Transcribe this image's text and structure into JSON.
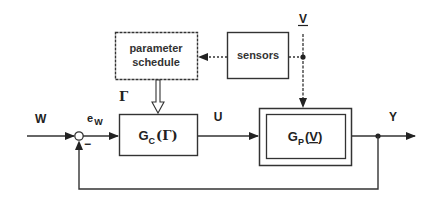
{
  "diagram": {
    "type": "block-diagram",
    "title": "",
    "colors": {
      "stroke": "#333333",
      "background": "#ffffff"
    },
    "blocks": {
      "parameter_schedule": {
        "line1": "parameter",
        "line2": "schedule"
      },
      "sensors": {
        "label": "sensors"
      },
      "controller": {
        "main": "G",
        "sub": "C",
        "arg": "(Γ)"
      },
      "plant": {
        "main": "G",
        "sub": "P",
        "arg_open": "(",
        "arg_var": "V",
        "arg_close": ")"
      }
    },
    "signals": {
      "reference": "W",
      "error_main": "e",
      "error_sub": "W",
      "scheduling_param": "Γ",
      "control": "U",
      "output": "Y",
      "operating_condition": "V"
    },
    "summing_junction": {
      "minus_sign": "−"
    },
    "edges": [
      {
        "from": "W",
        "to": "summing_junction"
      },
      {
        "from": "summing_junction",
        "to": "controller",
        "label": "e_W"
      },
      {
        "from": "controller",
        "to": "plant",
        "label": "U"
      },
      {
        "from": "plant",
        "to": "Y",
        "label": "Y"
      },
      {
        "from": "Y",
        "to": "summing_junction",
        "type": "feedback",
        "sign": "-"
      },
      {
        "from": "V",
        "to": "plant",
        "style": "dashed"
      },
      {
        "from": "V",
        "to": "sensors",
        "style": "dashed"
      },
      {
        "from": "sensors",
        "to": "parameter_schedule",
        "style": "dashed"
      },
      {
        "from": "parameter_schedule",
        "to": "controller",
        "label": "Γ",
        "style": "hollow-arrow"
      }
    ]
  }
}
